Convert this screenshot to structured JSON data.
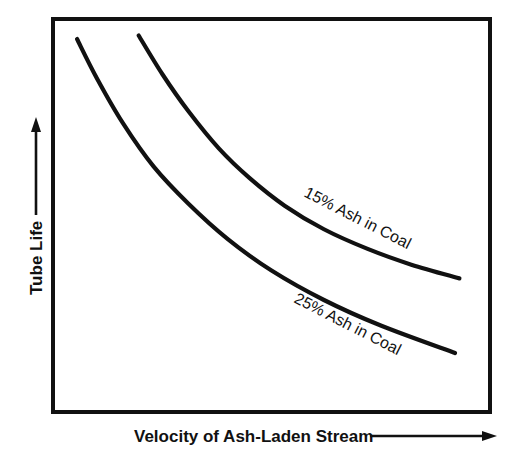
{
  "chart_data": {
    "type": "line",
    "title": "",
    "subtitle": "",
    "xlabel": "Velocity of Ash-Laden Stream",
    "ylabel": "Tube Life",
    "axes_style": "qualitative-schematic",
    "grid": false,
    "legend_position": "inline-along-curves",
    "xlim": [
      0,
      100
    ],
    "ylim": [
      0,
      100
    ],
    "x_tick_labels": [],
    "y_tick_labels": [],
    "x_axis_arrow": true,
    "y_axis_arrow": true,
    "line_color": "#111111",
    "frame_color": "#111111",
    "background_color": "#ffffff",
    "annotations": [
      {
        "text": "15% Ash in Coal",
        "series": "15% Ash in Coal",
        "rotation_deg": 27
      },
      {
        "text": "25% Ash in Coal",
        "series": "25% Ash in Coal",
        "rotation_deg": 27
      }
    ],
    "series": [
      {
        "name": "15% Ash in Coal",
        "label": "15% Ash in Coal",
        "color": "#111111",
        "points": [
          {
            "x": 19.6,
            "y": 95.8
          },
          {
            "x": 25.0,
            "y": 86.0
          },
          {
            "x": 31.0,
            "y": 76.5
          },
          {
            "x": 38.0,
            "y": 67.0
          },
          {
            "x": 45.0,
            "y": 59.5
          },
          {
            "x": 53.0,
            "y": 52.5
          },
          {
            "x": 62.0,
            "y": 46.5
          },
          {
            "x": 72.0,
            "y": 41.5
          },
          {
            "x": 82.0,
            "y": 37.5
          },
          {
            "x": 93.0,
            "y": 34.0
          }
        ]
      },
      {
        "name": "25% Ash in Coal",
        "label": "25% Ash in Coal",
        "color": "#111111",
        "points": [
          {
            "x": 5.5,
            "y": 94.9
          },
          {
            "x": 10.0,
            "y": 85.0
          },
          {
            "x": 16.0,
            "y": 73.5
          },
          {
            "x": 23.0,
            "y": 62.5
          },
          {
            "x": 31.0,
            "y": 53.0
          },
          {
            "x": 40.0,
            "y": 44.0
          },
          {
            "x": 50.0,
            "y": 36.0
          },
          {
            "x": 62.0,
            "y": 28.5
          },
          {
            "x": 75.0,
            "y": 22.0
          },
          {
            "x": 92.0,
            "y": 15.0
          }
        ]
      }
    ]
  },
  "axis": {
    "y_label": "Tube Life",
    "x_label": "Velocity of Ash-Laden Stream"
  },
  "curves": {
    "upper_label": "15% Ash in Coal",
    "lower_label": "25% Ash in Coal"
  },
  "colors": {
    "ink": "#111111",
    "paper": "#ffffff"
  }
}
